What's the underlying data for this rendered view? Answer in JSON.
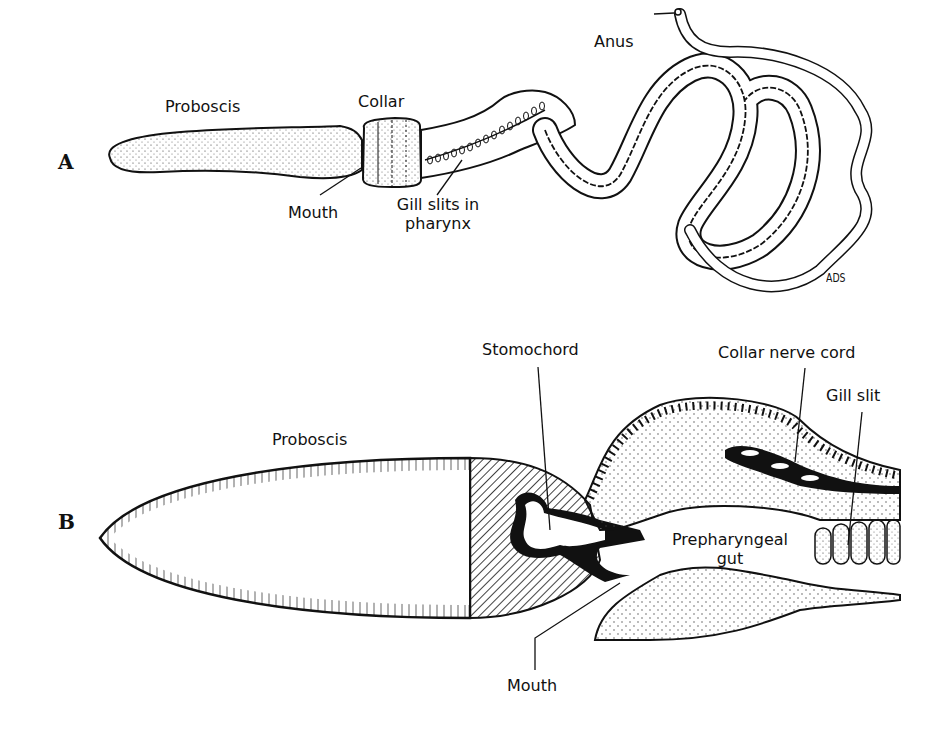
{
  "figure": {
    "panels": [
      {
        "id": "A",
        "letter": "A",
        "description": "External view of acorn worm (hemichordate)",
        "labels": {
          "proboscis": "Proboscis",
          "collar": "Collar",
          "mouth": "Mouth",
          "gill_slits_line1": "Gill slits in",
          "gill_slits_line2": "pharynx",
          "anus": "Anus"
        },
        "signature": "ADS"
      },
      {
        "id": "B",
        "letter": "B",
        "description": "Sagittal section through anterior end",
        "labels": {
          "proboscis": "Proboscis",
          "stomochord": "Stomochord",
          "collar_nerve_cord": "Collar nerve cord",
          "gill_slit": "Gill slit",
          "prepharyngeal_line1": "Prepharyngeal",
          "prepharyngeal_line2": "gut",
          "mouth": "Mouth"
        }
      }
    ]
  }
}
